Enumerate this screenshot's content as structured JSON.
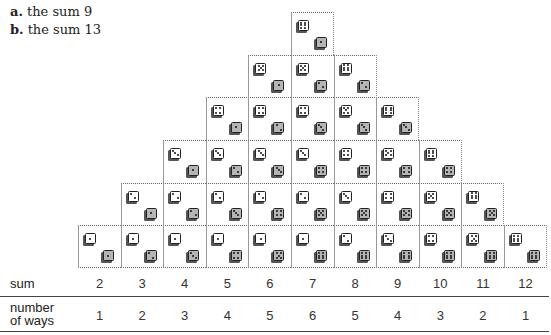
{
  "questions": [
    {
      "letter": "a.",
      "text": "the sum 9"
    },
    {
      "letter": "b.",
      "text": "the sum 13"
    }
  ],
  "table": {
    "sum_label": "sum",
    "ways_label_line1": "number",
    "ways_label_line2": "of ways",
    "sums": [
      "2",
      "3",
      "4",
      "5",
      "6",
      "7",
      "8",
      "9",
      "10",
      "11",
      "12"
    ],
    "ways": [
      "1",
      "2",
      "3",
      "4",
      "5",
      "6",
      "5",
      "4",
      "3",
      "2",
      "1"
    ]
  },
  "chart_data": {
    "type": "table",
    "categories": [
      2,
      3,
      4,
      5,
      6,
      7,
      8,
      9,
      10,
      11,
      12
    ],
    "series": [
      {
        "name": "number of ways",
        "values": [
          1,
          2,
          3,
          4,
          5,
          6,
          5,
          4,
          3,
          2,
          1
        ]
      }
    ],
    "xlabel": "sum",
    "ylabel": "number of ways",
    "cells": {
      "2": [
        [
          1,
          1
        ]
      ],
      "3": [
        [
          1,
          2
        ],
        [
          2,
          1
        ]
      ],
      "4": [
        [
          1,
          3
        ],
        [
          2,
          2
        ],
        [
          3,
          1
        ]
      ],
      "5": [
        [
          1,
          4
        ],
        [
          2,
          3
        ],
        [
          3,
          2
        ],
        [
          4,
          1
        ]
      ],
      "6": [
        [
          1,
          5
        ],
        [
          2,
          4
        ],
        [
          3,
          3
        ],
        [
          4,
          2
        ],
        [
          5,
          1
        ]
      ],
      "7": [
        [
          1,
          6
        ],
        [
          2,
          5
        ],
        [
          3,
          4
        ],
        [
          4,
          3
        ],
        [
          5,
          2
        ],
        [
          6,
          1
        ]
      ],
      "8": [
        [
          2,
          6
        ],
        [
          3,
          5
        ],
        [
          4,
          4
        ],
        [
          5,
          3
        ],
        [
          6,
          2
        ]
      ],
      "9": [
        [
          3,
          6
        ],
        [
          4,
          5
        ],
        [
          5,
          4
        ],
        [
          6,
          3
        ]
      ],
      "10": [
        [
          4,
          6
        ],
        [
          5,
          5
        ],
        [
          6,
          4
        ]
      ],
      "11": [
        [
          5,
          6
        ],
        [
          6,
          5
        ]
      ],
      "12": [
        [
          6,
          6
        ]
      ]
    }
  }
}
